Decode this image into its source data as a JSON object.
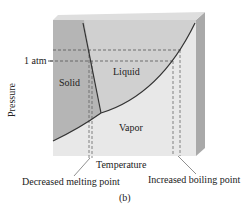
{
  "diagram": {
    "type": "phase-diagram",
    "axes": {
      "y_label": "Pressure",
      "x_label": "Temperature",
      "reference_pressure": "1 atm"
    },
    "regions": {
      "solid": "Solid",
      "liquid": "Liquid",
      "vapor": "Vapor"
    },
    "annotations": {
      "melting": "Decreased melting point",
      "boiling": "Increased boiling point"
    },
    "caption": "(b)",
    "colors": {
      "solid_fill": "#b4b4b4",
      "liquid_fill": "#cfcfcf",
      "vapor_fill": "#e6e6e6",
      "side_face": "#a8a8a8",
      "top_face": "#dcdcdc",
      "curve": "#333333",
      "dash": "#555555"
    }
  }
}
